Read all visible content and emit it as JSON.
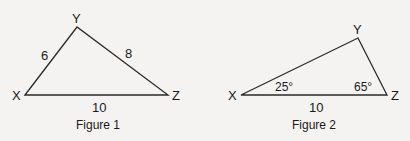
{
  "figure1": {
    "caption": "Figure 1",
    "vertices": {
      "X": "X",
      "Y": "Y",
      "Z": "Z"
    },
    "sides": {
      "XY": "6",
      "YZ": "8",
      "XZ": "10"
    }
  },
  "figure2": {
    "caption": "Figure 2",
    "vertices": {
      "X": "X",
      "Y": "Y",
      "Z": "Z"
    },
    "angles": {
      "X": "25°",
      "Z": "65°"
    },
    "sides": {
      "XZ": "10"
    }
  }
}
